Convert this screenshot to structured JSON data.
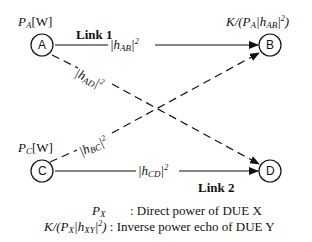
{
  "nodes": {
    "A": {
      "label": "A",
      "power": "P",
      "power_sub": "A",
      "power_unit": "[W]"
    },
    "B": {
      "label": "B",
      "echo": "K/(P",
      "echo_sub": "A",
      "echo_mid": "|h",
      "echo_sub2": "AB",
      "echo_end": "|",
      "echo_sup": "2",
      "echo_close": ")"
    },
    "C": {
      "label": "C",
      "power": "P",
      "power_sub": "C",
      "power_unit": "[W]"
    },
    "D": {
      "label": "D"
    }
  },
  "links": {
    "link1": {
      "title": "Link 1",
      "gain": "|h",
      "gain_sub": "AB",
      "gain_end": "|",
      "gain_sup": "2"
    },
    "link2": {
      "title": "Link 2",
      "gain": "|h",
      "gain_sub": "CD",
      "gain_end": "|",
      "gain_sup": "2"
    },
    "AD": {
      "gain": "|h",
      "gain_sub": "AD",
      "gain_end": "|",
      "gain_sup": "2"
    },
    "BC": {
      "gain": "|h",
      "gain_sub": "BC",
      "gain_end": "|",
      "gain_sup": "2"
    }
  },
  "legend": [
    {
      "sym": "P",
      "sym_sub": "X",
      "desc": ": Direct power of DUE X"
    },
    {
      "sym_a": "K/(P",
      "sym_sub": "X",
      "sym_b": "|h",
      "sym_sub2": "XY",
      "sym_c": "|",
      "sym_sup": "2",
      "sym_d": ")",
      "desc": ": Inverse power echo of DUE Y"
    }
  ],
  "colors": {
    "stroke": "#111111",
    "background": "#ffffff"
  }
}
